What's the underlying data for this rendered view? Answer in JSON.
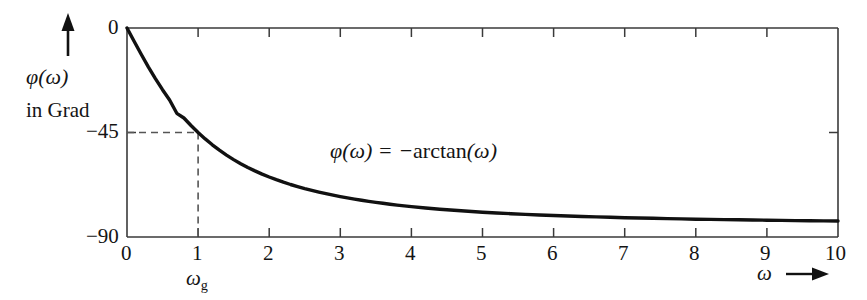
{
  "chart_data": {
    "type": "line",
    "title": "",
    "subtitle": "",
    "xlabel": "ω",
    "ylabel": "φ(ω)",
    "ylabel_line2": "in Grad",
    "ylabel_unit": "Grad",
    "xlim": [
      0,
      10
    ],
    "ylim": [
      -90,
      0
    ],
    "grid": false,
    "legend": null,
    "x_ticks": [
      0,
      1,
      2,
      3,
      4,
      5,
      6,
      7,
      8,
      9,
      10
    ],
    "x_tick_labels": [
      "0",
      "1",
      "2",
      "3",
      "4",
      "5",
      "6",
      "7",
      "8",
      "9",
      "10"
    ],
    "y_ticks": [
      0,
      -45,
      -90
    ],
    "y_tick_labels": [
      "0",
      "−45",
      "−90"
    ],
    "annotations": [
      {
        "name": "formula",
        "text": "φ(ω) = −arctan(ω)",
        "x": 3.1,
        "y": -49
      },
      {
        "name": "cutoff-frequency-label",
        "text": "ωg",
        "x": 1,
        "y": -90
      }
    ],
    "guide_lines": [
      {
        "name": "horizontal-dashed-45",
        "style": "dashed",
        "from": [
          0,
          -45
        ],
        "to": [
          1,
          -45
        ]
      },
      {
        "name": "vertical-dashed-omega-g",
        "style": "dashed",
        "from": [
          1,
          -45
        ],
        "to": [
          1,
          -90
        ]
      }
    ],
    "series": [
      {
        "name": "phase",
        "expression": "-arctan(omega) in degrees",
        "color": "#111111",
        "x": [
          0,
          0.1,
          0.2,
          0.3,
          0.4,
          0.5,
          0.6,
          0.7,
          0.8,
          0.9,
          1,
          1.2,
          1.4,
          1.6,
          1.8,
          2,
          2.5,
          3,
          3.5,
          4,
          4.5,
          5,
          5.5,
          6,
          6.5,
          7,
          7.5,
          8,
          8.5,
          9,
          9.5,
          10
        ],
        "values": [
          0,
          -5.7,
          -11.3,
          -16.7,
          -21.8,
          -26.6,
          -31,
          -35,
          -38.7,
          -42,
          -45,
          -50.2,
          -54.5,
          -58,
          -60.9,
          -63.4,
          -68.2,
          -71.6,
          -74.1,
          -76,
          -77.5,
          -78.7,
          -79.7,
          -80.5,
          -81.3,
          -81.9,
          -82.4,
          -82.9,
          -83.3,
          -83.7,
          -84,
          -84.3
        ]
      }
    ]
  },
  "axis_arrows": {
    "y_axis_arrow": "up-arrow",
    "x_axis_arrow": "right-arrow"
  }
}
